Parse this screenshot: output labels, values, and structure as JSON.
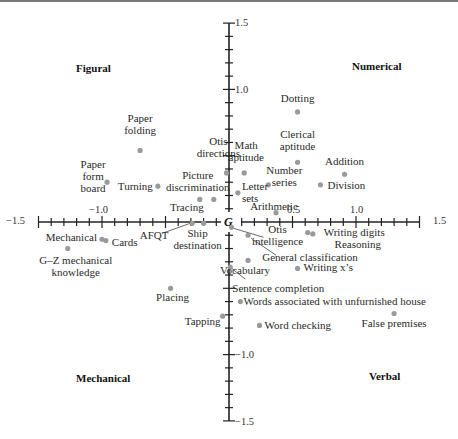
{
  "chart_data": {
    "type": "scatter",
    "title": "",
    "xlabel": "",
    "ylabel": "",
    "xlim": [
      -1.5,
      1.5
    ],
    "ylim": [
      -1.5,
      1.5
    ],
    "grid": false,
    "origin_label": "G",
    "x_ticks": {
      "major": [
        -1.5,
        -1.0,
        0.5,
        1.0,
        1.5
      ],
      "minor_step": 0.1
    },
    "y_ticks": {
      "major": [
        1.5,
        1.0,
        -1.0,
        -1.5
      ],
      "minor_step": 0.1
    },
    "tick_labels": {
      "x": [
        "−1.5",
        "−1.0",
        "0.5",
        "1.0",
        "1.5"
      ],
      "y": [
        "1.5",
        "1.0",
        "−1.0",
        "−1.5"
      ]
    },
    "quadrant_labels": {
      "top_left": "Figural",
      "top_right": "Numerical",
      "bottom_left": "Mechanical",
      "bottom_right": "Verbal"
    },
    "marker_color": "#9a9a9a",
    "points": [
      {
        "label": "Dotting",
        "x": 0.54,
        "y": 0.83
      },
      {
        "label": "Clerical aptitude",
        "x": 0.54,
        "y": 0.45
      },
      {
        "label": "Math aptitude",
        "x": 0.12,
        "y": 0.37
      },
      {
        "label": "Addition",
        "x": 0.91,
        "y": 0.36
      },
      {
        "label": "Number series",
        "x": 0.31,
        "y": 0.28
      },
      {
        "label": "Division",
        "x": 0.72,
        "y": 0.28
      },
      {
        "label": "Letter sets",
        "x": 0.07,
        "y": 0.22
      },
      {
        "label": "Arithmetic",
        "x": 0.37,
        "y": 0.07
      },
      {
        "label": "Otis directions",
        "x": -0.02,
        "y": 0.37
      },
      {
        "label": "Picture discrimination",
        "x": -0.12,
        "y": 0.17
      },
      {
        "label": "Tracing",
        "x": -0.23,
        "y": 0.17
      },
      {
        "label": "Paper folding",
        "x": -0.7,
        "y": 0.54
      },
      {
        "label": "Turning",
        "x": -0.56,
        "y": 0.27
      },
      {
        "label": "Paper form board",
        "x": -0.96,
        "y": 0.3
      },
      {
        "label": "Mechanical",
        "x": -1.0,
        "y": -0.13
      },
      {
        "label": "Cards",
        "x": -0.97,
        "y": -0.14
      },
      {
        "label": "G–Z mechanical knowledge",
        "x": -1.27,
        "y": -0.2
      },
      {
        "label": "AFQT",
        "x": -0.29,
        "y": -0.01
      },
      {
        "label": "Ship destination",
        "x": -0.2,
        "y": -0.01
      },
      {
        "label": "Placing",
        "x": -0.46,
        "y": -0.5
      },
      {
        "label": "Tapping",
        "x": -0.05,
        "y": -0.71
      },
      {
        "label": "Otis intelligence",
        "x": 0.02,
        "y": -0.04
      },
      {
        "label": "General classification",
        "x": 0.15,
        "y": -0.1
      },
      {
        "label": "Writing digits",
        "x": 0.62,
        "y": -0.08
      },
      {
        "label": "Reasoning",
        "x": 0.66,
        "y": -0.09
      },
      {
        "label": "Vocabulary",
        "x": 0.15,
        "y": -0.29
      },
      {
        "label": "Writing x’s",
        "x": 0.54,
        "y": -0.35
      },
      {
        "label": "Sentence completion",
        "x": 0.01,
        "y": -0.34
      },
      {
        "label": "Words associated with unfurnished house",
        "x": 0.09,
        "y": -0.6
      },
      {
        "label": "Word checking",
        "x": 0.24,
        "y": -0.78
      },
      {
        "label": "False premises",
        "x": 1.3,
        "y": -0.69
      }
    ]
  }
}
